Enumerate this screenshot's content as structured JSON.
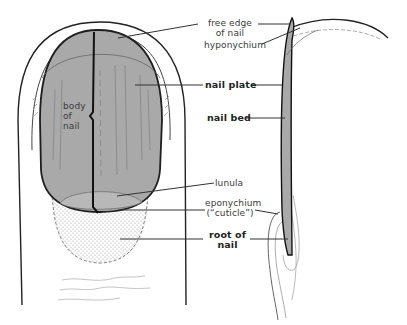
{
  "diagram": {
    "views": [
      "front view of fingertip",
      "side (sagittal) section"
    ],
    "labels": {
      "free_edge_line1": "free edge",
      "free_edge_line2": "of nail",
      "hyponychium": "hyponychium",
      "nail_plate": "nail plate",
      "nail_bed": "nail bed",
      "body_line1": "body",
      "body_line2": "of",
      "body_line3": "nail",
      "lunula": "lunula",
      "eponychium_line1": "eponychium",
      "eponychium_line2": "(“cuticle”)",
      "root_line1": "root of",
      "root_line2": "nail"
    },
    "colors": {
      "nail_fill": "#a9a9a9",
      "lunula_fill": "#b8b8b8",
      "outline": "#222222",
      "leader_line": "#333333",
      "background": "#ffffff"
    }
  }
}
